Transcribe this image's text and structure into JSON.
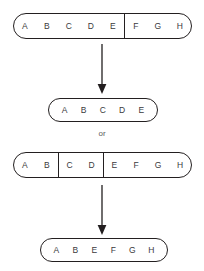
{
  "diagram": {
    "or_label": "or",
    "stroke_color": "#231f20",
    "text_color": "#3a3a3c",
    "background_color": "#ffffff",
    "rows": [
      {
        "id": "parent-strand-1",
        "name": "parent-capsule-top",
        "x": 13,
        "y": 13,
        "width": 179,
        "height": 26,
        "radius": 13,
        "segments": [
          {
            "id": "seg-a-e",
            "letters": [
              "A",
              "B",
              "C",
              "D",
              "E"
            ],
            "flex": 5
          },
          {
            "id": "seg-f-h",
            "letters": [
              "F",
              "G",
              "H"
            ],
            "flex": 3
          }
        ]
      },
      {
        "id": "offspring-strand-1",
        "name": "offspring-capsule-first",
        "x": 48,
        "y": 98,
        "width": 110,
        "height": 24,
        "radius": 12,
        "segments": [
          {
            "id": "seg-a-e-only",
            "letters": [
              "A",
              "B",
              "C",
              "D",
              "E"
            ],
            "flex": 5
          }
        ]
      },
      {
        "id": "parent-strand-2",
        "name": "parent-capsule-bottom",
        "x": 13,
        "y": 152,
        "width": 179,
        "height": 26,
        "radius": 13,
        "segments": [
          {
            "id": "seg-a-b",
            "letters": [
              "A",
              "B"
            ],
            "flex": 2
          },
          {
            "id": "seg-c-d",
            "letters": [
              "C",
              "D"
            ],
            "flex": 2
          },
          {
            "id": "seg-e-h",
            "letters": [
              "E",
              "F",
              "G",
              "H"
            ],
            "flex": 4
          }
        ]
      },
      {
        "id": "offspring-strand-2",
        "name": "offspring-capsule-second",
        "x": 40,
        "y": 238,
        "width": 128,
        "height": 24,
        "radius": 12,
        "segments": [
          {
            "id": "seg-abefgh",
            "letters": [
              "A",
              "B",
              "E",
              "F",
              "G",
              "H"
            ],
            "flex": 6
          }
        ]
      }
    ],
    "arrows": [
      {
        "id": "arrow-top",
        "name": "down-arrow-top",
        "x": 102,
        "y_start": 45,
        "y_end": 94
      },
      {
        "id": "arrow-bottom",
        "name": "down-arrow-bottom",
        "x": 102,
        "y_start": 186,
        "y_end": 234
      }
    ],
    "or_position": {
      "x": 0,
      "y": 129
    }
  }
}
